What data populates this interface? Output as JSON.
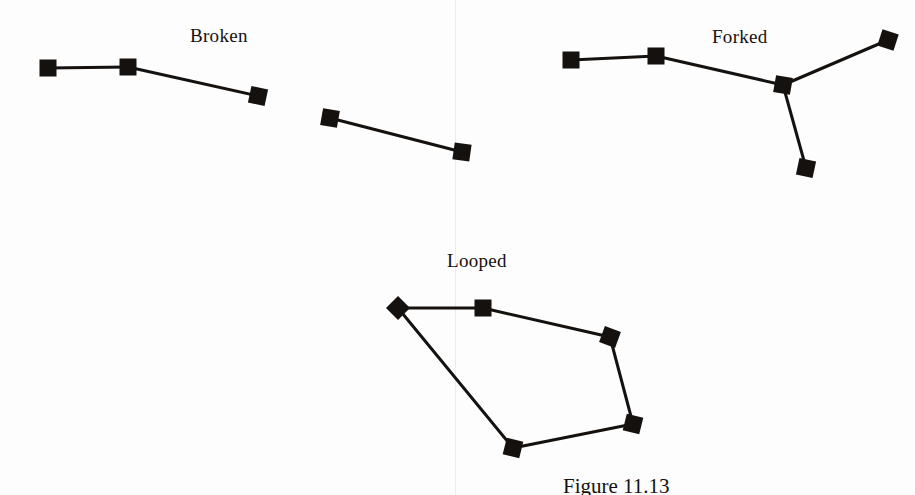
{
  "figure": {
    "background_color": "#fdfdfd",
    "ink_color": "#14110f",
    "caption": "Figure 11.13",
    "page_fold_x": 455,
    "labels": {
      "broken": "Broken",
      "forked": "Forked",
      "looped": "Looped"
    }
  },
  "chart_data": {
    "type": "diagram",
    "title": "Figure 11.13",
    "subtitle": "",
    "xlabel": "",
    "ylabel": "",
    "grid": false,
    "legend": "none",
    "xlim": [
      0,
      915
    ],
    "ylim": [
      0,
      495
    ],
    "marker_style": {
      "shape": "filled-square",
      "size": 17,
      "color": "#14110f"
    },
    "line_style": {
      "color": "#14110f",
      "width": 3
    },
    "groups": [
      {
        "name": "Broken",
        "label": "Broken",
        "label_position": {
          "x": 190,
          "y": 25
        },
        "nodes": [
          {
            "id": "b1",
            "x": 48,
            "y": 68,
            "rotation": 0
          },
          {
            "id": "b2",
            "x": 128,
            "y": 67,
            "rotation": 0
          },
          {
            "id": "b3",
            "x": 258,
            "y": 96,
            "rotation": 12
          },
          {
            "id": "b4",
            "x": 330,
            "y": 118,
            "rotation": 10
          },
          {
            "id": "b5",
            "x": 462,
            "y": 152,
            "rotation": 8
          }
        ],
        "edges": [
          {
            "from": "b1",
            "to": "b2"
          },
          {
            "from": "b2",
            "to": "b3"
          },
          {
            "from": "b4",
            "to": "b5"
          }
        ]
      },
      {
        "name": "Forked",
        "label": "Forked",
        "label_position": {
          "x": 712,
          "y": 26
        },
        "nodes": [
          {
            "id": "f1",
            "x": 571,
            "y": 60,
            "rotation": 0
          },
          {
            "id": "f2",
            "x": 656,
            "y": 56,
            "rotation": 0
          },
          {
            "id": "f3",
            "x": 783,
            "y": 85,
            "rotation": 10
          },
          {
            "id": "f4",
            "x": 888,
            "y": 40,
            "rotation": 18
          },
          {
            "id": "f5",
            "x": 806,
            "y": 168,
            "rotation": 12
          }
        ],
        "edges": [
          {
            "from": "f1",
            "to": "f2"
          },
          {
            "from": "f2",
            "to": "f3"
          },
          {
            "from": "f3",
            "to": "f4"
          },
          {
            "from": "f3",
            "to": "f5"
          }
        ]
      },
      {
        "name": "Looped",
        "label": "Looped",
        "label_position": {
          "x": 447,
          "y": 250
        },
        "nodes": [
          {
            "id": "l1",
            "x": 398,
            "y": 308,
            "rotation": 45
          },
          {
            "id": "l2",
            "x": 483,
            "y": 308,
            "rotation": 0
          },
          {
            "id": "l3",
            "x": 610,
            "y": 337,
            "rotation": 20
          },
          {
            "id": "l4",
            "x": 633,
            "y": 424,
            "rotation": 14
          },
          {
            "id": "l5",
            "x": 513,
            "y": 448,
            "rotation": 14
          }
        ],
        "edges": [
          {
            "from": "l1",
            "to": "l2"
          },
          {
            "from": "l2",
            "to": "l3"
          },
          {
            "from": "l3",
            "to": "l4"
          },
          {
            "from": "l4",
            "to": "l5"
          },
          {
            "from": "l5",
            "to": "l1"
          }
        ]
      }
    ]
  }
}
